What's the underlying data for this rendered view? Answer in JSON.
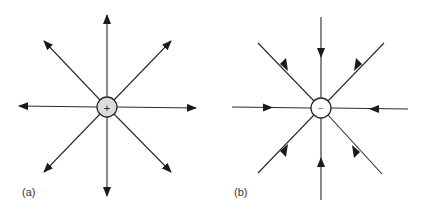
{
  "figures": [
    {
      "id": "a",
      "label": "(a)",
      "charge_symbol": "+",
      "charge_type": "positive",
      "field_direction": "outward",
      "circle_fill": "#dcdcdc",
      "line_count": 8
    },
    {
      "id": "b",
      "label": "(b)",
      "charge_symbol": "−",
      "charge_type": "negative",
      "field_direction": "inward",
      "circle_fill": "#ffffff",
      "line_count": 8
    }
  ],
  "colors": {
    "line": "#2a2a2a",
    "background": "#ffffff"
  }
}
